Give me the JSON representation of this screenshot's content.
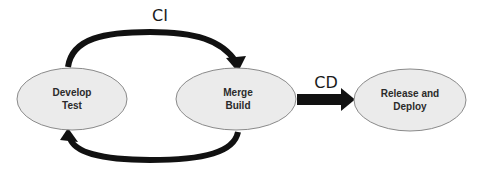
{
  "diagram": {
    "type": "ci-cd-flow",
    "nodes": [
      {
        "id": "develop",
        "lines": [
          "Develop",
          "Test"
        ]
      },
      {
        "id": "merge",
        "lines": [
          "Merge",
          "Build"
        ]
      },
      {
        "id": "release",
        "lines": [
          "Release and",
          "Deploy"
        ]
      }
    ],
    "edges": [
      {
        "from": "develop",
        "to": "merge",
        "label": "CI",
        "style": "curved-top"
      },
      {
        "from": "merge",
        "to": "develop",
        "label": "",
        "style": "curved-bottom"
      },
      {
        "from": "merge",
        "to": "release",
        "label": "CD",
        "style": "block-arrow"
      }
    ],
    "labels": {
      "ci": "CI",
      "cd": "CD"
    },
    "colors": {
      "node_fill": "#ebebeb",
      "node_stroke": "#8a8a8a",
      "arrow": "#111111"
    }
  }
}
